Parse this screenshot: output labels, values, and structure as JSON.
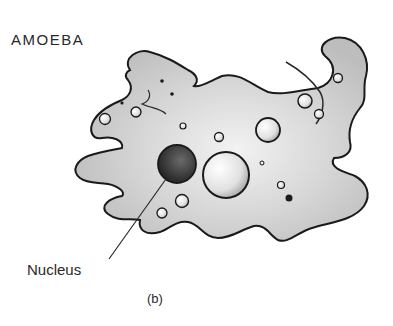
{
  "diagram": {
    "title": "AMOEBA",
    "labels": [
      {
        "text": "Nucleus",
        "points_to": "nucleus"
      }
    ],
    "caption": "(b)",
    "parts": [
      "cell-body",
      "pseudopodia",
      "nucleus",
      "vacuoles",
      "granules"
    ],
    "colors": {
      "cytoplasm": "#c8c8c8",
      "outline": "#1a1a1a",
      "nucleus": "#3a3a3a",
      "text": "#2a2a2a"
    }
  }
}
